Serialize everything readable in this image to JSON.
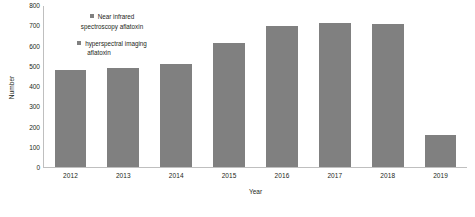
{
  "chart_data": {
    "type": "bar",
    "title": "",
    "xlabel": "Year",
    "ylabel": "Number",
    "categories": [
      "2012",
      "2013",
      "2014",
      "2015",
      "2016",
      "2017",
      "2018",
      "2019"
    ],
    "values": [
      480,
      490,
      510,
      615,
      700,
      715,
      710,
      160
    ],
    "series": [
      {
        "name": "Near infrared spectroscopy aflatoxin",
        "values": [
          480,
          490,
          510,
          615,
          700,
          715,
          710,
          160
        ]
      }
    ],
    "ylim": [
      0,
      800
    ],
    "ytick_step": 100,
    "yticks": [
      0,
      100,
      200,
      300,
      400,
      500,
      600,
      700,
      800
    ],
    "grid": false,
    "legend_position": "upper-left-inside",
    "bar_color": "#808080",
    "axis_color": "#bfbfbf",
    "text_color": "#231f20"
  },
  "legend": {
    "items": [
      {
        "label_line1": "Near infrared",
        "label_line2": "spectroscopy aflatoxin",
        "color": "#808080"
      },
      {
        "label_line1": "hyperspectral imaging",
        "label_line2": "aflatoxin",
        "color": "#808080"
      }
    ]
  }
}
